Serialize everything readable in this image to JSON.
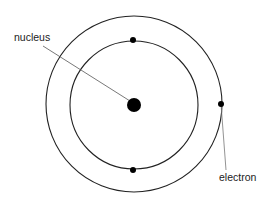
{
  "diagram": {
    "title": "",
    "labels": {
      "nucleus": "nucleus",
      "electron": "electron"
    },
    "colors": {
      "background": "#ffffff",
      "orbit": "#222222",
      "particle": "#000000",
      "leader_line": "#555555",
      "text": "#222222"
    },
    "nodes": [
      {
        "id": "nucleus",
        "shape": "filled-circle",
        "cx": 134,
        "cy": 105,
        "r": 7
      },
      {
        "id": "inner-orbit",
        "shape": "circle",
        "cx": 134,
        "cy": 105,
        "r": 64
      },
      {
        "id": "outer-orbit",
        "shape": "circle",
        "cx": 134,
        "cy": 104,
        "r": 88
      },
      {
        "id": "electron-inner-top",
        "shape": "filled-circle",
        "cx": 133,
        "cy": 40,
        "r": 3
      },
      {
        "id": "electron-inner-bottom",
        "shape": "filled-circle",
        "cx": 133,
        "cy": 170,
        "r": 3
      },
      {
        "id": "electron-outer-right",
        "shape": "filled-circle",
        "cx": 221,
        "cy": 104,
        "r": 3
      }
    ],
    "annotations": [
      {
        "label": "nucleus",
        "points_to": "nucleus"
      },
      {
        "label": "electron",
        "points_to": "electron-outer-right"
      }
    ]
  }
}
